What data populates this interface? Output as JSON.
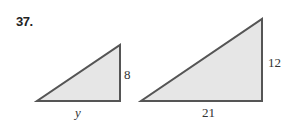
{
  "problem": {
    "number": "37."
  },
  "colors": {
    "fill": "#e6e6e6",
    "stroke": "#555555"
  },
  "triangles": [
    {
      "name": "small",
      "vertical_label": "8",
      "horizontal_label": "y"
    },
    {
      "name": "large",
      "vertical_label": "12",
      "horizontal_label": "21"
    }
  ]
}
